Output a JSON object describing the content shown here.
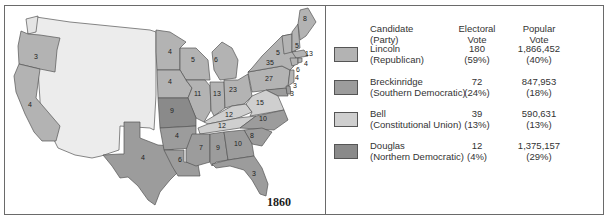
{
  "map": {
    "year": "1860",
    "colors": {
      "lincoln": "#b3b3b3",
      "breckinridge": "#9c9c9c",
      "bell": "#cfcfcf",
      "douglas": "#8a8a8a",
      "territory": "#ececec",
      "border": "#555555"
    },
    "states": [
      {
        "name": "Washington",
        "votes": "",
        "party": "territory"
      },
      {
        "name": "Oregon",
        "votes": "3",
        "party": "lincoln"
      },
      {
        "name": "California",
        "votes": "4",
        "party": "lincoln"
      },
      {
        "name": "Texas",
        "votes": "4",
        "party": "breckinridge"
      },
      {
        "name": "Minnesota",
        "votes": "4",
        "party": "lincoln"
      },
      {
        "name": "Wisconsin",
        "votes": "5",
        "party": "lincoln"
      },
      {
        "name": "Iowa",
        "votes": "4",
        "party": "lincoln"
      },
      {
        "name": "Michigan",
        "votes": "6",
        "party": "lincoln"
      },
      {
        "name": "Illinois",
        "votes": "11",
        "party": "lincoln"
      },
      {
        "name": "Indiana",
        "votes": "13",
        "party": "lincoln"
      },
      {
        "name": "Ohio",
        "votes": "23",
        "party": "lincoln"
      },
      {
        "name": "Pennsylvania",
        "votes": "27",
        "party": "lincoln"
      },
      {
        "name": "New York",
        "votes": "35",
        "party": "lincoln"
      },
      {
        "name": "Vermont",
        "votes": "5",
        "party": "lincoln"
      },
      {
        "name": "New Hampshire",
        "votes": "5",
        "party": "lincoln"
      },
      {
        "name": "Maine",
        "votes": "8",
        "party": "lincoln"
      },
      {
        "name": "Massachusetts",
        "votes": "13",
        "party": "lincoln"
      },
      {
        "name": "Rhode Island",
        "votes": "4",
        "party": "lincoln"
      },
      {
        "name": "Connecticut",
        "votes": "6",
        "party": "lincoln"
      },
      {
        "name": "New Jersey",
        "votes": "4",
        "party": "lincoln"
      },
      {
        "name": "Delaware",
        "votes": "3",
        "party": "breckinridge"
      },
      {
        "name": "Maryland",
        "votes": "3",
        "party": "breckinridge"
      },
      {
        "name": "Missouri",
        "votes": "9",
        "party": "douglas"
      },
      {
        "name": "Kentucky",
        "votes": "12",
        "party": "bell"
      },
      {
        "name": "Virginia",
        "votes": "15",
        "party": "bell"
      },
      {
        "name": "Tennessee",
        "votes": "12",
        "party": "bell"
      },
      {
        "name": "North Carolina",
        "votes": "10",
        "party": "breckinridge"
      },
      {
        "name": "South Carolina",
        "votes": "8",
        "party": "breckinridge"
      },
      {
        "name": "Arkansas",
        "votes": "4",
        "party": "breckinridge"
      },
      {
        "name": "Louisiana",
        "votes": "6",
        "party": "breckinridge"
      },
      {
        "name": "Mississippi",
        "votes": "7",
        "party": "breckinridge"
      },
      {
        "name": "Alabama",
        "votes": "9",
        "party": "breckinridge"
      },
      {
        "name": "Georgia",
        "votes": "10",
        "party": "breckinridge"
      },
      {
        "name": "Florida",
        "votes": "3",
        "party": "breckinridge"
      }
    ]
  },
  "legend": {
    "headers": {
      "candidate": "Candidate",
      "party": "(Party)",
      "electoral_1": "Electoral",
      "electoral_2": "Vote",
      "popular_1": "Popular",
      "popular_2": "Vote"
    },
    "rows": [
      {
        "candidate": "Lincoln",
        "party": "(Republican)",
        "electoral": "180",
        "electoral_pct": "(59%)",
        "popular": "1,866,452",
        "popular_pct": "(40%)",
        "color": "#b3b3b3"
      },
      {
        "candidate": "Breckinridge",
        "party": "(Southern Democratic)",
        "electoral": "72",
        "electoral_pct": "(24%)",
        "popular": "847,953",
        "popular_pct": "(18%)",
        "color": "#9c9c9c"
      },
      {
        "candidate": "Bell",
        "party": "(Constitutional Union)",
        "electoral": "39",
        "electoral_pct": "(13%)",
        "popular": "590,631",
        "popular_pct": "(13%)",
        "color": "#cfcfcf"
      },
      {
        "candidate": "Douglas",
        "party": "(Northern Democratic)",
        "electoral": "12",
        "electoral_pct": "(4%)",
        "popular": "1,375,157",
        "popular_pct": "(29%)",
        "color": "#8a8a8a"
      }
    ]
  }
}
